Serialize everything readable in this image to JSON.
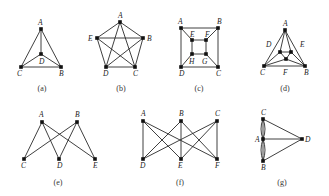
{
  "figure": {
    "panels": [
      {
        "id": "a",
        "caption": "(a)",
        "vertices": [
          {
            "name": "A",
            "x": 41,
            "y": 29,
            "lx": 38,
            "ly": 25
          },
          {
            "name": "B",
            "x": 61,
            "y": 67,
            "lx": 59,
            "ly": 76
          },
          {
            "name": "C",
            "x": 21,
            "y": 67,
            "lx": 17,
            "ly": 76
          },
          {
            "name": "D",
            "x": 41,
            "y": 54,
            "lx": 39,
            "ly": 64
          }
        ],
        "edges": [
          [
            "A",
            "B"
          ],
          [
            "A",
            "C"
          ],
          [
            "A",
            "D"
          ],
          [
            "B",
            "C"
          ],
          [
            "B",
            "D"
          ],
          [
            "C",
            "D"
          ]
        ]
      },
      {
        "id": "b",
        "caption": "(b)",
        "vertices": [
          {
            "name": "A",
            "x": 120,
            "y": 22,
            "lx": 118,
            "ly": 18
          },
          {
            "name": "B",
            "x": 143,
            "y": 38,
            "lx": 147,
            "ly": 41
          },
          {
            "name": "C",
            "x": 135,
            "y": 67,
            "lx": 133,
            "ly": 76
          },
          {
            "name": "D",
            "x": 106,
            "y": 67,
            "lx": 103,
            "ly": 76
          },
          {
            "name": "E",
            "x": 97,
            "y": 38,
            "lx": 88,
            "ly": 41
          }
        ],
        "edges": [
          [
            "A",
            "B"
          ],
          [
            "A",
            "C"
          ],
          [
            "A",
            "D"
          ],
          [
            "A",
            "E"
          ],
          [
            "B",
            "C"
          ],
          [
            "B",
            "D"
          ],
          [
            "B",
            "E"
          ],
          [
            "C",
            "D"
          ],
          [
            "C",
            "E"
          ],
          [
            "D",
            "E"
          ]
        ]
      },
      {
        "id": "c",
        "caption": "(c)",
        "vertices": [
          {
            "name": "A",
            "x": 181,
            "y": 28,
            "lx": 178,
            "ly": 24
          },
          {
            "name": "B",
            "x": 218,
            "y": 28,
            "lx": 217,
            "ly": 24
          },
          {
            "name": "C",
            "x": 218,
            "y": 67,
            "lx": 216,
            "ly": 76
          },
          {
            "name": "D",
            "x": 181,
            "y": 67,
            "lx": 179,
            "ly": 76
          },
          {
            "name": "E",
            "x": 192,
            "y": 40,
            "lx": 190,
            "ly": 37
          },
          {
            "name": "F",
            "x": 206,
            "y": 40,
            "lx": 205,
            "ly": 37
          },
          {
            "name": "G",
            "x": 206,
            "y": 54,
            "lx": 202,
            "ly": 64
          },
          {
            "name": "H",
            "x": 192,
            "y": 54,
            "lx": 189,
            "ly": 64
          }
        ],
        "edges": [
          [
            "A",
            "B"
          ],
          [
            "B",
            "C"
          ],
          [
            "C",
            "D"
          ],
          [
            "D",
            "A"
          ],
          [
            "E",
            "F"
          ],
          [
            "F",
            "G"
          ],
          [
            "G",
            "H"
          ],
          [
            "H",
            "E"
          ],
          [
            "A",
            "E"
          ],
          [
            "B",
            "F"
          ],
          [
            "C",
            "G"
          ],
          [
            "D",
            "H"
          ]
        ]
      },
      {
        "id": "d",
        "caption": "(d)",
        "vertices": [
          {
            "name": "A",
            "x": 285,
            "y": 30,
            "lx": 283,
            "ly": 26
          },
          {
            "name": "B",
            "x": 305,
            "y": 66,
            "lx": 304,
            "ly": 75
          },
          {
            "name": "C",
            "x": 264,
            "y": 66,
            "lx": 260,
            "ly": 75
          },
          {
            "name": "",
            "x": 280,
            "y": 52,
            "lx": 0,
            "ly": 0
          },
          {
            "name": "",
            "x": 291,
            "y": 52,
            "lx": 0,
            "ly": 0
          },
          {
            "name": "",
            "x": 286,
            "y": 59,
            "lx": 0,
            "ly": 0
          }
        ],
        "side_labels": [
          {
            "name": "D",
            "x": 266,
            "y": 47
          },
          {
            "name": "E",
            "x": 300,
            "y": 47
          },
          {
            "name": "F",
            "x": 283,
            "y": 75
          }
        ],
        "edges": [
          [
            "0",
            "1"
          ],
          [
            "1",
            "2"
          ],
          [
            "2",
            "0"
          ],
          [
            "0",
            "3"
          ],
          [
            "0",
            "4"
          ],
          [
            "2",
            "3"
          ],
          [
            "2",
            "5"
          ],
          [
            "1",
            "4"
          ],
          [
            "1",
            "5"
          ],
          [
            "3",
            "4"
          ],
          [
            "4",
            "5"
          ],
          [
            "5",
            "3"
          ]
        ]
      },
      {
        "id": "e",
        "caption": "(e)",
        "vertices": [
          {
            "name": "A",
            "x": 42,
            "y": 122,
            "lx": 39,
            "ly": 117
          },
          {
            "name": "B",
            "x": 77,
            "y": 122,
            "lx": 75,
            "ly": 117
          },
          {
            "name": "C",
            "x": 24,
            "y": 159,
            "lx": 21,
            "ly": 168
          },
          {
            "name": "D",
            "x": 59,
            "y": 159,
            "lx": 57,
            "ly": 168
          },
          {
            "name": "E",
            "x": 95,
            "y": 159,
            "lx": 93,
            "ly": 168
          }
        ],
        "edges": [
          [
            "A",
            "C"
          ],
          [
            "A",
            "D"
          ],
          [
            "A",
            "E"
          ],
          [
            "B",
            "C"
          ],
          [
            "B",
            "D"
          ],
          [
            "B",
            "E"
          ]
        ]
      },
      {
        "id": "f",
        "caption": "(f)",
        "vertices": [
          {
            "name": "A",
            "x": 143,
            "y": 121,
            "lx": 141,
            "ly": 116
          },
          {
            "name": "B",
            "x": 181,
            "y": 121,
            "lx": 179,
            "ly": 116
          },
          {
            "name": "C",
            "x": 217,
            "y": 121,
            "lx": 215,
            "ly": 116
          },
          {
            "name": "D",
            "x": 143,
            "y": 159,
            "lx": 140,
            "ly": 168
          },
          {
            "name": "E",
            "x": 181,
            "y": 159,
            "lx": 178,
            "ly": 168
          },
          {
            "name": "F",
            "x": 217,
            "y": 159,
            "lx": 215,
            "ly": 168
          }
        ],
        "edges": [
          [
            "A",
            "D"
          ],
          [
            "A",
            "E"
          ],
          [
            "A",
            "F"
          ],
          [
            "B",
            "D"
          ],
          [
            "B",
            "E"
          ],
          [
            "B",
            "F"
          ],
          [
            "C",
            "D"
          ],
          [
            "C",
            "E"
          ],
          [
            "C",
            "F"
          ]
        ]
      },
      {
        "id": "g",
        "caption": "(g)",
        "vertices": [
          {
            "name": "A",
            "x": 263,
            "y": 139,
            "lx": 255,
            "ly": 142
          },
          {
            "name": "B",
            "x": 263,
            "y": 161,
            "lx": 261,
            "ly": 170
          },
          {
            "name": "C",
            "x": 263,
            "y": 119,
            "lx": 261,
            "ly": 115
          },
          {
            "name": "D",
            "x": 302,
            "y": 139,
            "lx": 305,
            "ly": 142
          }
        ],
        "edges": [
          [
            "C",
            "D"
          ],
          [
            "A",
            "D"
          ],
          [
            "B",
            "D"
          ]
        ],
        "double_edges": [
          [
            "C",
            "A"
          ],
          [
            "A",
            "B"
          ]
        ]
      }
    ],
    "captions": [
      {
        "text": "(a)",
        "x": 42,
        "y": 91
      },
      {
        "text": "(b)",
        "x": 121,
        "y": 91
      },
      {
        "text": "(c)",
        "x": 199,
        "y": 91
      },
      {
        "text": "(d)",
        "x": 285,
        "y": 91
      },
      {
        "text": "(e)",
        "x": 58,
        "y": 185
      },
      {
        "text": "(f)",
        "x": 180,
        "y": 185
      },
      {
        "text": "(g)",
        "x": 282,
        "y": 185
      }
    ]
  }
}
